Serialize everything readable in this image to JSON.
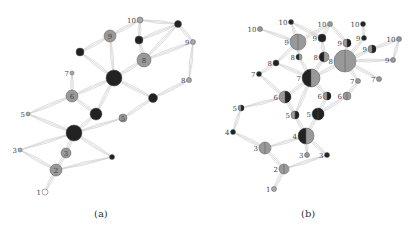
{
  "panels": [
    {
      "caption": "(a)",
      "nodes": [
        {
          "id": "a1",
          "label": "1",
          "x": 45,
          "y": 192,
          "r": 3,
          "fill": "#ffffff",
          "half": null
        },
        {
          "id": "a2",
          "label": "2",
          "x": 56,
          "y": 170,
          "r": 6,
          "fill": "#999999",
          "half": null
        },
        {
          "id": "a3",
          "label": "3",
          "x": 66,
          "y": 153,
          "r": 5,
          "fill": "#999999",
          "half": null
        },
        {
          "id": "a3s",
          "label": "3",
          "x": 20,
          "y": 150,
          "r": 2,
          "fill": "#aaaaaa",
          "half": null
        },
        {
          "id": "a3b",
          "label": "",
          "x": 112,
          "y": 157,
          "r": 2.5,
          "fill": "#222222",
          "half": null
        },
        {
          "id": "a4",
          "label": "",
          "x": 74,
          "y": 133,
          "r": 8,
          "fill": "#222222",
          "half": null
        },
        {
          "id": "a5s",
          "label": "5",
          "x": 28,
          "y": 114,
          "r": 2,
          "fill": "#aaaaaa",
          "half": null
        },
        {
          "id": "a5",
          "label": "5",
          "x": 123,
          "y": 118,
          "r": 4,
          "fill": "#999999",
          "half": null
        },
        {
          "id": "a5b",
          "label": "",
          "x": 96,
          "y": 114,
          "r": 6,
          "fill": "#222222",
          "half": null
        },
        {
          "id": "a6",
          "label": "6",
          "x": 72,
          "y": 96,
          "r": 6,
          "fill": "#999999",
          "half": null
        },
        {
          "id": "a6b",
          "label": "",
          "x": 153,
          "y": 98,
          "r": 4.5,
          "fill": "#222222",
          "half": null
        },
        {
          "id": "a7",
          "label": "7",
          "x": 72,
          "y": 73,
          "r": 2,
          "fill": "#aaaaaa",
          "half": null
        },
        {
          "id": "a7b",
          "label": "",
          "x": 114,
          "y": 78,
          "r": 8,
          "fill": "#222222",
          "half": null
        },
        {
          "id": "a8",
          "label": "8",
          "x": 144,
          "y": 60,
          "r": 7,
          "fill": "#999999",
          "half": null
        },
        {
          "id": "a8s",
          "label": "8",
          "x": 189,
          "y": 80,
          "r": 2.5,
          "fill": "#aaaaaa",
          "half": null
        },
        {
          "id": "a8b",
          "label": "",
          "x": 80,
          "y": 52,
          "r": 4,
          "fill": "#222222",
          "half": null
        },
        {
          "id": "a9",
          "label": "9",
          "x": 110,
          "y": 36,
          "r": 6,
          "fill": "#999999",
          "half": null
        },
        {
          "id": "a9s",
          "label": "9",
          "x": 193,
          "y": 42,
          "r": 2.5,
          "fill": "#aaaaaa",
          "half": null
        },
        {
          "id": "a9b",
          "label": "",
          "x": 139,
          "y": 40,
          "r": 4,
          "fill": "#222222",
          "half": null
        },
        {
          "id": "a10",
          "label": "10",
          "x": 140,
          "y": 20,
          "r": 3,
          "fill": "#aaaaaa",
          "half": null
        },
        {
          "id": "a10b",
          "label": "",
          "x": 178,
          "y": 24,
          "r": 3.5,
          "fill": "#222222",
          "half": null
        }
      ],
      "edges": [
        [
          "a1",
          "a2"
        ],
        [
          "a2",
          "a3"
        ],
        [
          "a2",
          "a3s"
        ],
        [
          "a2",
          "a3b"
        ],
        [
          "a3",
          "a4"
        ],
        [
          "a3s",
          "a4"
        ],
        [
          "a3b",
          "a4"
        ],
        [
          "a4",
          "a5s"
        ],
        [
          "a4",
          "a5b"
        ],
        [
          "a4",
          "a5"
        ],
        [
          "a5s",
          "a6"
        ],
        [
          "a5b",
          "a6"
        ],
        [
          "a5",
          "a6b"
        ],
        [
          "a5b",
          "a7b"
        ],
        [
          "a6",
          "a7b"
        ],
        [
          "a6",
          "a7"
        ],
        [
          "a6b",
          "a7b"
        ],
        [
          "a6b",
          "a8s"
        ],
        [
          "a7b",
          "a8"
        ],
        [
          "a7b",
          "a8b"
        ],
        [
          "a7b",
          "a9"
        ],
        [
          "a8",
          "a9b"
        ],
        [
          "a8",
          "a9s"
        ],
        [
          "a8s",
          "a9s"
        ],
        [
          "a8",
          "a10b"
        ],
        [
          "a9",
          "a10"
        ],
        [
          "a9",
          "a8b"
        ],
        [
          "a9b",
          "a10"
        ],
        [
          "a9b",
          "a10b"
        ],
        [
          "a10",
          "a10b"
        ],
        [
          "a9s",
          "a10b"
        ]
      ]
    },
    {
      "caption": "(b)",
      "nodes": [
        {
          "id": "b1",
          "label": "1",
          "x": 274,
          "y": 189,
          "r": 2.5,
          "fill": "#aaaaaa",
          "half": null
        },
        {
          "id": "b2",
          "label": "2",
          "x": 284,
          "y": 169,
          "r": 5,
          "fill": "#999999",
          "half": "#999999"
        },
        {
          "id": "b3",
          "label": "3",
          "x": 265,
          "y": 148,
          "r": 6,
          "fill": "#999999",
          "half": "#999999"
        },
        {
          "id": "b3a",
          "label": "3",
          "x": 307,
          "y": 155,
          "r": 2.5,
          "fill": "#999999",
          "half": null
        },
        {
          "id": "b3b",
          "label": "3",
          "x": 327,
          "y": 155,
          "r": 2.5,
          "fill": "#222222",
          "half": null
        },
        {
          "id": "b4",
          "label": "4",
          "x": 306,
          "y": 136,
          "r": 8,
          "fill": "#222222",
          "half": "#999999"
        },
        {
          "id": "b4s",
          "label": "4",
          "x": 233,
          "y": 132,
          "r": 2.5,
          "fill": "#222222",
          "half": null
        },
        {
          "id": "b5a",
          "label": "5",
          "x": 295,
          "y": 115,
          "r": 4,
          "fill": "#999999",
          "half": "#222222"
        },
        {
          "id": "b5b",
          "label": "5",
          "x": 318,
          "y": 114,
          "r": 6,
          "fill": "#222222",
          "half": "#222222"
        },
        {
          "id": "b5s",
          "label": "5",
          "x": 241,
          "y": 108,
          "r": 3,
          "fill": "#999999",
          "half": "#222222"
        },
        {
          "id": "b6a",
          "label": "6",
          "x": 285,
          "y": 97,
          "r": 6,
          "fill": "#999999",
          "half": "#222222"
        },
        {
          "id": "b6b",
          "label": "6",
          "x": 327,
          "y": 96,
          "r": 4,
          "fill": "#999999",
          "half": "#222222"
        },
        {
          "id": "b6c",
          "label": "6",
          "x": 347,
          "y": 96,
          "r": 4,
          "fill": "#999999",
          "half": "#999999"
        },
        {
          "id": "b7",
          "label": "7",
          "x": 311,
          "y": 78,
          "r": 9,
          "fill": "#222222",
          "half": "#999999"
        },
        {
          "id": "b7a",
          "label": "7",
          "x": 259,
          "y": 74,
          "r": 2.5,
          "fill": "#222222",
          "half": null
        },
        {
          "id": "b7b",
          "label": "7",
          "x": 358,
          "y": 81,
          "r": 2.5,
          "fill": "#999999",
          "half": null
        },
        {
          "id": "b7c",
          "label": "7",
          "x": 379,
          "y": 79,
          "r": 2.5,
          "fill": "#999999",
          "half": null
        },
        {
          "id": "b8a",
          "label": "8",
          "x": 276,
          "y": 63,
          "r": 3,
          "fill": "#222222",
          "half": null
        },
        {
          "id": "b8b",
          "label": "8",
          "x": 299,
          "y": 57,
          "r": 3,
          "fill": "#222222",
          "half": "#999999"
        },
        {
          "id": "b8c",
          "label": "8",
          "x": 324,
          "y": 57,
          "r": 5,
          "fill": "#222222",
          "half": "#999999"
        },
        {
          "id": "b8big",
          "label": "8",
          "x": 345,
          "y": 61,
          "r": 11,
          "fill": "#999999",
          "half": "#999999"
        },
        {
          "id": "b9a",
          "label": "9",
          "x": 298,
          "y": 42,
          "r": 8,
          "fill": "#999999",
          "half": "#999999"
        },
        {
          "id": "b9b",
          "label": "9",
          "x": 322,
          "y": 38,
          "r": 4,
          "fill": "#222222",
          "half": null
        },
        {
          "id": "b9c",
          "label": "9",
          "x": 347,
          "y": 43,
          "r": 4,
          "fill": "#999999",
          "half": "#222222"
        },
        {
          "id": "b9d",
          "label": "9",
          "x": 364,
          "y": 38,
          "r": 2.5,
          "fill": "#222222",
          "half": null
        },
        {
          "id": "b9e",
          "label": "9",
          "x": 372,
          "y": 49,
          "r": 4,
          "fill": "#999999",
          "half": "#222222"
        },
        {
          "id": "b9f",
          "label": "9",
          "x": 393,
          "y": 60,
          "r": 2.5,
          "fill": "#999999",
          "half": null
        },
        {
          "id": "b10a",
          "label": "10",
          "x": 260,
          "y": 29,
          "r": 2.5,
          "fill": "#999999",
          "half": null
        },
        {
          "id": "b10b",
          "label": "10",
          "x": 291,
          "y": 22,
          "r": 2.5,
          "fill": "#222222",
          "half": null
        },
        {
          "id": "b10c",
          "label": "10",
          "x": 330,
          "y": 24,
          "r": 2.5,
          "fill": "#999999",
          "half": null
        },
        {
          "id": "b10d",
          "label": "10",
          "x": 363,
          "y": 24,
          "r": 2.5,
          "fill": "#222222",
          "half": null
        },
        {
          "id": "b10e",
          "label": "10",
          "x": 399,
          "y": 39,
          "r": 2.5,
          "fill": "#999999",
          "half": null
        }
      ],
      "edges": [
        [
          "b1",
          "b2"
        ],
        [
          "b2",
          "b3"
        ],
        [
          "b2",
          "b3b"
        ],
        [
          "b3",
          "b4"
        ],
        [
          "b3",
          "b4s"
        ],
        [
          "b3a",
          "b4"
        ],
        [
          "b3b",
          "b4"
        ],
        [
          "b4",
          "b5a"
        ],
        [
          "b4",
          "b5b"
        ],
        [
          "b4s",
          "b5s"
        ],
        [
          "b5s",
          "b6a"
        ],
        [
          "b5a",
          "b6a"
        ],
        [
          "b5b",
          "b6b"
        ],
        [
          "b5b",
          "b6c"
        ],
        [
          "b5a",
          "b7"
        ],
        [
          "b6a",
          "b7"
        ],
        [
          "b6b",
          "b7"
        ],
        [
          "b6c",
          "b7b"
        ],
        [
          "b6a",
          "b7a"
        ],
        [
          "b7",
          "b8a"
        ],
        [
          "b7",
          "b8b"
        ],
        [
          "b7",
          "b8c"
        ],
        [
          "b7",
          "b8big"
        ],
        [
          "b7a",
          "b8a"
        ],
        [
          "b7b",
          "b8big"
        ],
        [
          "b7c",
          "b8big"
        ],
        [
          "b8a",
          "b9a"
        ],
        [
          "b8b",
          "b9a"
        ],
        [
          "b8c",
          "b9b"
        ],
        [
          "b8big",
          "b9c"
        ],
        [
          "b8big",
          "b9e"
        ],
        [
          "b8big",
          "b9f"
        ],
        [
          "b8big",
          "b9d"
        ],
        [
          "b9a",
          "b10a"
        ],
        [
          "b9a",
          "b10b"
        ],
        [
          "b9b",
          "b10c"
        ],
        [
          "b9c",
          "b10c"
        ],
        [
          "b9d",
          "b10d"
        ],
        [
          "b9e",
          "b10e"
        ],
        [
          "b9f",
          "b10e"
        ],
        [
          "b9a",
          "b10c"
        ],
        [
          "b9b",
          "b10b"
        ]
      ]
    }
  ],
  "colors": {
    "edge": "#c8c8c8",
    "gray": "#999999",
    "black": "#222222",
    "stroke": "#555555"
  }
}
